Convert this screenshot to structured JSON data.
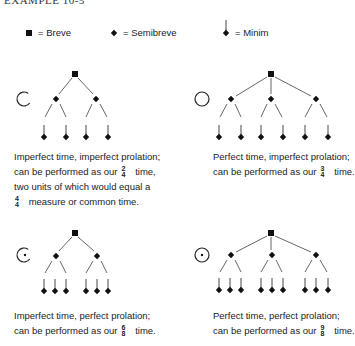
{
  "title": "EXAMPLE 10-5",
  "legend": {
    "breve": "= Breve",
    "semibreve": "= Semibreve",
    "minim": "= Minim"
  },
  "panels": [
    {
      "id": "imperfect-time-imperfect-prolation",
      "sign": "C",
      "breve_count": 1,
      "semibreves": 2,
      "minims_per_semibreve": 2,
      "caption": {
        "line1": "Imperfect time, imperfect prolation;",
        "line2_pre": "can be performed as our",
        "ts1_num": "2",
        "ts1_den": "4",
        "line2_post": "time,",
        "line3": "two units of which would equal a",
        "ts2_num": "4",
        "ts2_den": "4",
        "line4_post": "measure or common time."
      }
    },
    {
      "id": "perfect-time-imperfect-prolation",
      "sign": "O",
      "breve_count": 1,
      "semibreves": 3,
      "minims_per_semibreve": 2,
      "caption": {
        "line1": "Perfect time, imperfect prolation;",
        "line2_pre": "can be performed as our",
        "ts1_num": "3",
        "ts1_den": "4",
        "line2_post": "time."
      }
    },
    {
      "id": "imperfect-time-perfect-prolation",
      "sign": "C with dot",
      "breve_count": 1,
      "semibreves": 2,
      "minims_per_semibreve": 3,
      "caption": {
        "line1": "Imperfect time, perfect prolation;",
        "line2_pre": "can be performed as our",
        "ts1_num": "6",
        "ts1_den": "8",
        "line2_post": "time."
      }
    },
    {
      "id": "perfect-time-perfect-prolation",
      "sign": "O with dot",
      "breve_count": 1,
      "semibreves": 3,
      "minims_per_semibreve": 3,
      "caption": {
        "line1": "Perfect time, perfect prolation;",
        "line2_pre": "can be performed as our",
        "ts1_num": "9",
        "ts1_den": "8",
        "line2_post": "time."
      }
    }
  ]
}
